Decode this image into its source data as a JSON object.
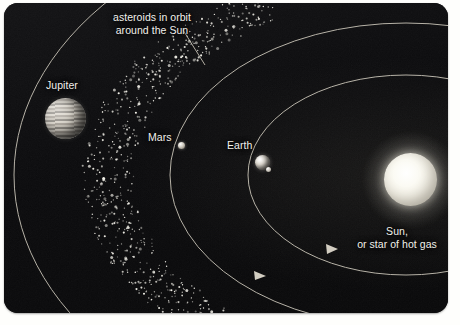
{
  "figure": {
    "kind": "solar-system-diagram",
    "background_color": "#0a0a0c",
    "paper_color": "#fefefc",
    "label_color": "#f2f1ec"
  },
  "labels": {
    "asteroids_line1": "asteroids in orbit",
    "asteroids_line2": "around the Sun",
    "jupiter": "Jupiter",
    "mars": "Mars",
    "earth": "Earth",
    "sun_line1": "Sun,",
    "sun_line2": "or star of hot gas"
  },
  "bodies": [
    {
      "name": "Jupiter",
      "type": "planet",
      "cx": 61,
      "cy": 115,
      "r": 20.5,
      "style": "banded-gas-giant"
    },
    {
      "name": "Mars",
      "type": "planet",
      "cx": 177,
      "cy": 142,
      "r": 3.5,
      "style": "small-rocky"
    },
    {
      "name": "Earth",
      "type": "planet",
      "cx": 258,
      "cy": 159,
      "r": 7.5,
      "style": "small-rocky"
    },
    {
      "name": "Moon",
      "type": "moon",
      "cx": 264,
      "cy": 166,
      "r": 2.5,
      "style": "tiny-rocky"
    },
    {
      "name": "Sun",
      "type": "star",
      "cx": 406,
      "cy": 176,
      "r": 26.5,
      "style": "glowing-star"
    }
  ],
  "orbits": [
    {
      "name": "jupiter-orbit",
      "rx": 390,
      "ry": 265,
      "stroke": "#cfcabd",
      "width": 1.0,
      "arrow": false
    },
    {
      "name": "mars-orbit",
      "rx": 235,
      "ry": 152,
      "stroke": "#cfcabd",
      "width": 1.0,
      "arrow": true
    },
    {
      "name": "earth-orbit",
      "rx": 157,
      "ry": 100,
      "stroke": "#cfcabd",
      "width": 1.0,
      "arrow": true
    }
  ],
  "asteroid_belt": {
    "description": "dense ring of small white dots between the Mars and Jupiter orbits",
    "dot_color": "#f4f2ea",
    "rx_inner": 272,
    "rx_outer": 322,
    "center_x": 406,
    "center_y": 176
  },
  "leader_lines": [
    {
      "name": "asteroid-leader",
      "x1": 183,
      "y1": 30,
      "x2": 205,
      "y2": 64
    }
  ]
}
